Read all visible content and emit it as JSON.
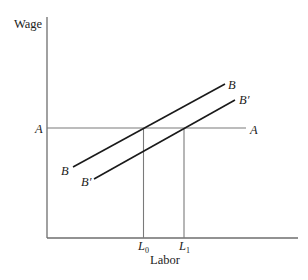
{
  "diagram": {
    "y_axis_label": "Wage",
    "x_axis_label": "Labor",
    "horizontal_line": {
      "label_left": "A",
      "label_right": "A"
    },
    "curve_B": {
      "label_upper": "B",
      "label_lower": "B"
    },
    "curve_B_prime": {
      "label_upper": "B′",
      "label_lower": "B′"
    },
    "x_ticks": [
      {
        "label": "L",
        "subscript": "0"
      },
      {
        "label": "L",
        "subscript": "1"
      }
    ],
    "colors": {
      "axis": "#6e6e6e",
      "curve": "#1a1a1a",
      "guide": "#7a7a7a",
      "text": "#222222"
    }
  }
}
